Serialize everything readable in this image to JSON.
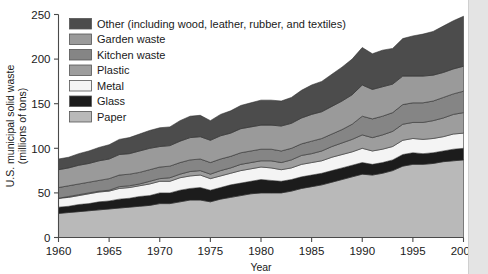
{
  "chart_data": {
    "type": "area",
    "title": "",
    "xlabel": "Year",
    "ylabel": "U.S. municipal solid waste (millions of tons)",
    "ylabel_line1": "U.S. municipal solid waste",
    "ylabel_line2": "(millions of tons)",
    "xlim": [
      1960,
      2000
    ],
    "ylim": [
      0,
      250
    ],
    "grid": false,
    "legend_position": "upper-left-inside",
    "stacked": true,
    "stack_order_bottom_to_top": [
      "Paper",
      "Glass",
      "Metal",
      "Plastic",
      "Kitchen waste",
      "Garden waste",
      "Other (including wood, leather, rubber, and textiles)"
    ],
    "x_tick_labels": [
      "1960",
      "1965",
      "1970",
      "1975",
      "1980",
      "1985",
      "1990",
      "1995",
      "2000"
    ],
    "x_ticks": [
      1960,
      1965,
      1970,
      1975,
      1980,
      1985,
      1990,
      1995,
      2000
    ],
    "y_tick_labels": [
      "0",
      "50",
      "100",
      "150",
      "200",
      "250"
    ],
    "y_ticks": [
      0,
      50,
      100,
      150,
      200,
      250
    ],
    "x": [
      1960,
      1961,
      1962,
      1963,
      1964,
      1965,
      1966,
      1967,
      1968,
      1969,
      1970,
      1971,
      1972,
      1973,
      1974,
      1975,
      1976,
      1977,
      1978,
      1979,
      1980,
      1981,
      1982,
      1983,
      1984,
      1985,
      1986,
      1987,
      1988,
      1989,
      1990,
      1991,
      1992,
      1993,
      1994,
      1995,
      1996,
      1997,
      1998,
      1999,
      2000
    ],
    "series": [
      {
        "name": "Paper",
        "color": "#b9b9b9",
        "values": [
          27,
          28,
          29,
          30,
          31,
          32,
          33,
          34,
          35,
          36,
          38,
          38,
          40,
          42,
          42,
          40,
          43,
          45,
          47,
          49,
          50,
          50,
          50,
          52,
          55,
          57,
          59,
          62,
          65,
          68,
          71,
          70,
          72,
          75,
          80,
          82,
          82,
          83,
          85,
          86,
          87
        ]
      },
      {
        "name": "Glass",
        "color": "#1c1c1c",
        "values": [
          7,
          7,
          8,
          8,
          9,
          9,
          10,
          10,
          11,
          11,
          12,
          12,
          13,
          13,
          14,
          13,
          13,
          14,
          14,
          14,
          15,
          14,
          13,
          13,
          13,
          13,
          13,
          13,
          13,
          13,
          13,
          12,
          12,
          12,
          13,
          13,
          12,
          12,
          12,
          13,
          13
        ]
      },
      {
        "name": "Metal",
        "color": "#f4f4f4",
        "values": [
          10,
          10,
          10,
          11,
          11,
          11,
          12,
          12,
          12,
          13,
          13,
          13,
          14,
          14,
          14,
          13,
          13,
          13,
          14,
          14,
          14,
          14,
          13,
          13,
          14,
          14,
          14,
          15,
          15,
          15,
          16,
          15,
          15,
          15,
          16,
          16,
          16,
          16,
          16,
          17,
          17
        ]
      },
      {
        "name": "Plastic",
        "color": "#9d9d9d",
        "values": [
          0,
          1,
          1,
          1,
          1,
          1,
          2,
          2,
          2,
          3,
          3,
          4,
          4,
          5,
          5,
          5,
          6,
          6,
          7,
          7,
          7,
          8,
          8,
          9,
          10,
          10,
          11,
          12,
          13,
          14,
          15,
          15,
          16,
          17,
          18,
          18,
          19,
          20,
          21,
          22,
          23
        ]
      },
      {
        "name": "Kitchen waste",
        "color": "#858585",
        "values": [
          12,
          12,
          12,
          12,
          12,
          13,
          13,
          13,
          13,
          13,
          13,
          13,
          13,
          13,
          13,
          13,
          13,
          13,
          13,
          13,
          13,
          13,
          13,
          13,
          13,
          14,
          14,
          14,
          15,
          17,
          21,
          21,
          21,
          21,
          22,
          22,
          22,
          22,
          23,
          23,
          24
        ]
      },
      {
        "name": "Garden waste",
        "color": "#9a9a9a",
        "values": [
          20,
          20,
          21,
          21,
          22,
          22,
          23,
          23,
          24,
          24,
          23,
          23,
          24,
          25,
          25,
          25,
          26,
          26,
          27,
          27,
          27,
          27,
          28,
          28,
          29,
          30,
          30,
          31,
          32,
          33,
          35,
          33,
          33,
          32,
          32,
          30,
          30,
          29,
          28,
          28,
          28
        ]
      },
      {
        "name": "Other (including wood, leather, rubber, and textiles)",
        "color": "#4c4c4c",
        "values": [
          12,
          12,
          13,
          14,
          15,
          16,
          17,
          18,
          19,
          20,
          21,
          21,
          23,
          24,
          24,
          22,
          24,
          25,
          26,
          27,
          28,
          28,
          28,
          29,
          31,
          33,
          34,
          36,
          38,
          40,
          42,
          40,
          41,
          40,
          42,
          45,
          47,
          49,
          52,
          54,
          56
        ]
      }
    ],
    "legend_entries": [
      {
        "label": "Other (including wood, leather, rubber, and textiles)",
        "color": "#4c4c4c"
      },
      {
        "label": "Garden waste",
        "color": "#9a9a9a"
      },
      {
        "label": "Kitchen waste",
        "color": "#858585"
      },
      {
        "label": "Plastic",
        "color": "#9d9d9d"
      },
      {
        "label": "Metal",
        "color": "#f4f4f4"
      },
      {
        "label": "Glass",
        "color": "#1c1c1c"
      },
      {
        "label": "Paper",
        "color": "#b9b9b9"
      }
    ]
  }
}
